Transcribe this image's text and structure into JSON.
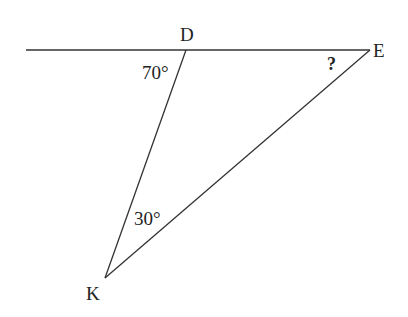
{
  "diagram": {
    "type": "geometry-triangle",
    "stroke_color": "#333333",
    "label_color": "#222222",
    "points": {
      "D": {
        "label": "D",
        "x": 186,
        "y": 50
      },
      "E": {
        "label": "E",
        "x": 370,
        "y": 50
      },
      "K": {
        "label": "K",
        "x": 105,
        "y": 278
      },
      "line_start": {
        "x": 26,
        "y": 50
      }
    },
    "angles": {
      "D": {
        "label": "70°"
      },
      "E": {
        "label": "?"
      },
      "K": {
        "label": "30°"
      }
    }
  }
}
